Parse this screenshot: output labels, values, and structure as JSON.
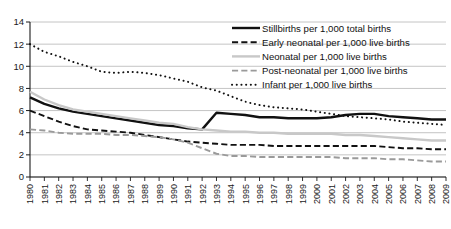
{
  "chart_data": {
    "type": "line",
    "title": "",
    "subtitle": "",
    "xlabel": "",
    "ylabel": "",
    "xlim": [
      1980,
      2009
    ],
    "ylim": [
      0,
      14
    ],
    "yticks": [
      0,
      2,
      4,
      6,
      8,
      10,
      12,
      14
    ],
    "grid": "horizontal",
    "legend_position": "top-right",
    "categories": [
      "1980",
      "1981",
      "1982",
      "1983",
      "1984",
      "1985",
      "1986",
      "1987",
      "1988",
      "1989",
      "1990",
      "1991",
      "1992",
      "1993",
      "1994",
      "1995",
      "1996",
      "1997",
      "1998",
      "1999",
      "2000",
      "2001",
      "2002",
      "2003",
      "2004",
      "2005",
      "2006",
      "2007",
      "2008",
      "2009"
    ],
    "series": [
      {
        "name": "Stillbirths per 1,000 total births",
        "style": "solid",
        "color": "#111111",
        "width": 2.4,
        "values": [
          7.2,
          6.6,
          6.2,
          5.9,
          5.7,
          5.5,
          5.3,
          5.1,
          4.9,
          4.7,
          4.6,
          4.4,
          4.3,
          5.8,
          5.7,
          5.6,
          5.4,
          5.4,
          5.3,
          5.3,
          5.3,
          5.4,
          5.6,
          5.7,
          5.7,
          5.5,
          5.4,
          5.3,
          5.2,
          5.2
        ]
      },
      {
        "name": "Early neonatal per 1,000 live births",
        "style": "dashed",
        "color": "#111111",
        "width": 1.9,
        "values": [
          6.0,
          5.5,
          5.0,
          4.6,
          4.3,
          4.2,
          4.1,
          4.0,
          3.8,
          3.6,
          3.4,
          3.2,
          3.1,
          3.0,
          2.9,
          2.9,
          2.9,
          2.8,
          2.8,
          2.8,
          2.8,
          2.8,
          2.8,
          2.8,
          2.8,
          2.7,
          2.6,
          2.6,
          2.5,
          2.5
        ]
      },
      {
        "name": "Neonatal per 1,000 live births",
        "style": "solid",
        "color": "#c8c8c8",
        "width": 2.4,
        "values": [
          7.7,
          7.0,
          6.5,
          6.1,
          5.9,
          5.7,
          5.5,
          5.3,
          5.1,
          4.9,
          4.8,
          4.5,
          4.3,
          4.2,
          4.1,
          4.1,
          4.0,
          4.0,
          3.9,
          3.9,
          3.9,
          3.9,
          3.8,
          3.8,
          3.7,
          3.6,
          3.5,
          3.4,
          3.3,
          3.3
        ]
      },
      {
        "name": "Post-neonatal per 1,000 live births",
        "style": "dashed",
        "color": "#9a9a9a",
        "width": 1.9,
        "values": [
          4.3,
          4.2,
          4.0,
          3.9,
          3.9,
          3.9,
          3.8,
          3.8,
          3.7,
          3.6,
          3.4,
          3.1,
          2.6,
          2.1,
          1.9,
          1.9,
          1.8,
          1.8,
          1.8,
          1.8,
          1.8,
          1.8,
          1.7,
          1.7,
          1.7,
          1.6,
          1.6,
          1.5,
          1.4,
          1.4
        ]
      },
      {
        "name": "Infant per 1,000 live births",
        "style": "dotted",
        "color": "#111111",
        "width": 2.0,
        "values": [
          12.0,
          11.3,
          10.9,
          10.4,
          10.0,
          9.5,
          9.4,
          9.5,
          9.4,
          9.2,
          8.9,
          8.6,
          8.1,
          7.8,
          7.3,
          6.8,
          6.5,
          6.3,
          6.2,
          6.1,
          5.9,
          5.7,
          5.5,
          5.4,
          5.3,
          5.2,
          5.0,
          4.9,
          4.8,
          4.7
        ]
      }
    ]
  },
  "axes": {
    "y_tick_labels": [
      "0",
      "2",
      "4",
      "6",
      "8",
      "10",
      "12",
      "14"
    ],
    "x_tick_labels": [
      "1980",
      "1981",
      "1982",
      "1983",
      "1984",
      "1985",
      "1986",
      "1987",
      "1988",
      "1989",
      "1990",
      "1991",
      "1992",
      "1993",
      "1994",
      "1995",
      "1996",
      "1997",
      "1998",
      "1999",
      "2000",
      "2001",
      "2002",
      "2003",
      "2004",
      "2005",
      "2006",
      "2007",
      "2008",
      "2009"
    ]
  },
  "legend": {
    "items": [
      {
        "label": "Stillbirths per 1,000 total births",
        "marker": "solid-black-line",
        "color": "#111111"
      },
      {
        "label": "Early neonatal per 1,000 live births",
        "marker": "dashed-black-line",
        "color": "#111111"
      },
      {
        "label": "Neonatal per 1,000 live births",
        "marker": "solid-grey-line",
        "color": "#c8c8c8"
      },
      {
        "label": "Post-neonatal per 1,000 live births",
        "marker": "dashed-grey-line",
        "color": "#9a9a9a"
      },
      {
        "label": "Infant per 1,000 live births",
        "marker": "dotted-black-line",
        "color": "#111111"
      }
    ]
  },
  "colors": {
    "gridline": "#b5b5b5",
    "axis": "#1a1a1a",
    "background": "#ffffff"
  }
}
